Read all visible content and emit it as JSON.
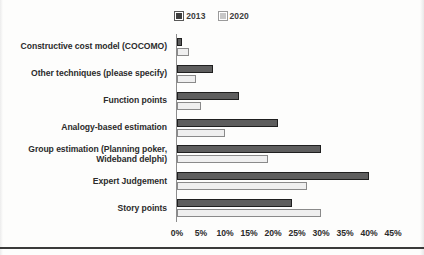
{
  "chart_data": {
    "type": "bar",
    "orientation": "horizontal",
    "title": "",
    "xlabel": "",
    "ylabel": "",
    "xlim": [
      0,
      45
    ],
    "xticks": [
      "0%",
      "5%",
      "10%",
      "15%",
      "20%",
      "25%",
      "30%",
      "35%",
      "40%",
      "45%"
    ],
    "xtick_values": [
      0,
      5,
      10,
      15,
      20,
      25,
      30,
      35,
      40,
      45
    ],
    "grid": false,
    "legend_position": "top-center",
    "categories": [
      "Constructive cost model (COCOMO)",
      "Other techniques (please specify)",
      "Function points",
      "Analogy-based estimation",
      "Group estimation (Planning poker, Wideband delphi)",
      "Expert Judgement",
      "Story points"
    ],
    "series": [
      {
        "name": "2013",
        "color": "#5e5e5e",
        "values": [
          1,
          7.5,
          13,
          21,
          30,
          40,
          24
        ]
      },
      {
        "name": "2020",
        "color": "#efefef",
        "values": [
          2.5,
          4,
          5,
          10,
          19,
          27,
          30
        ]
      }
    ]
  },
  "legend": {
    "entries": [
      {
        "label": "2013",
        "swatch": "legend-swatch-2013"
      },
      {
        "label": "2020",
        "swatch": "legend-swatch-2020"
      }
    ]
  },
  "colors": {
    "series_2013": "#5e5e5e",
    "series_2013_border": "#1f1f1f",
    "series_2020": "#efefef",
    "series_2020_border": "#8a8a8a",
    "axis": "#8d8d8d",
    "text": "#2b2b2b",
    "background": "#fdfdfc"
  }
}
